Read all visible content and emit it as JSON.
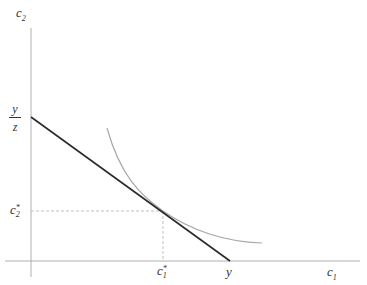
{
  "diagram": {
    "type": "budget-constraint-indifference-curve",
    "axes": {
      "y_label": {
        "base": "c",
        "sub": "2"
      },
      "x_label": {
        "base": "c",
        "sub": "1"
      }
    },
    "labels": {
      "y_intercept": {
        "numerator": "y",
        "denominator": "z"
      },
      "x_intercept": "y",
      "c2_star": {
        "base": "c",
        "sub": "2",
        "sup": "*"
      },
      "c1_star": {
        "base": "c",
        "sub": "1",
        "sup": "*"
      }
    },
    "colors": {
      "axis": "#b0b0b0",
      "budget_line": "#2a2a2a",
      "indifference_curve": "#a8a8a8",
      "guide": "#c0c0c0"
    }
  }
}
